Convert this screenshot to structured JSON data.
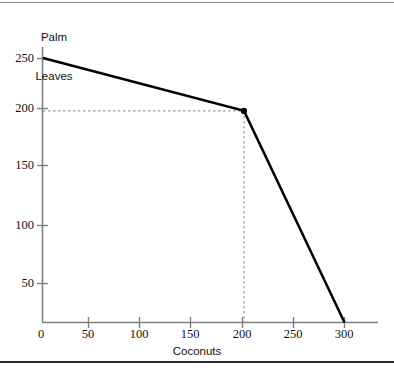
{
  "chart_data": {
    "type": "line",
    "title": "",
    "xlabel": "Coconuts",
    "ylabel": "Palm Leaves",
    "ylabel_lines": [
      "Palm",
      "Leaves"
    ],
    "xlim": [
      0,
      330
    ],
    "ylim": [
      0,
      265
    ],
    "grid": false,
    "legend": null,
    "series": [
      {
        "name": "Production possibilities frontier",
        "x": [
          0,
          200,
          300
        ],
        "values": [
          250,
          200,
          0
        ],
        "color": "#000000",
        "linewidth": 2.5
      }
    ],
    "markers": [
      {
        "name": "kink-point",
        "x": 200,
        "y": 200,
        "color": "#000000"
      }
    ],
    "annotations": [
      {
        "name": "guide-horizontal",
        "type": "dashed-line",
        "y": 200,
        "x_from": 0,
        "x_to": 200,
        "color": "#9a9a9a"
      },
      {
        "name": "guide-vertical",
        "type": "dashed-line",
        "x": 200,
        "y_from": 0,
        "y_to": 200,
        "color": "#9a9a9a"
      }
    ],
    "xticks": [
      0,
      50,
      100,
      150,
      200,
      250,
      300
    ],
    "xtick_labels": [
      "0",
      "50",
      "100",
      "150",
      "200",
      "250",
      "300"
    ],
    "yticks": [
      0,
      50,
      100,
      150,
      200,
      250
    ],
    "ytick_labels": [
      "0",
      "50",
      "100",
      "150",
      "200",
      "250"
    ],
    "axis_color": "#808080",
    "text_color": "#111111"
  },
  "frame": {
    "top_rule_color": "#8c8c8c",
    "bottom_rule_color": "#2b2b2b"
  }
}
